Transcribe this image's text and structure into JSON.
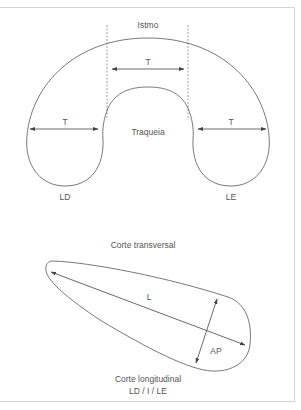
{
  "figure": {
    "transverse": {
      "isthmus_label": "Istmo",
      "trachea_label": "Traqueia",
      "right_lobe_label": "LD",
      "left_lobe_label": "LE",
      "measure_isthmus": "T",
      "measure_right_lobe": "T",
      "measure_left_lobe": "T",
      "caption": "Corte transversal"
    },
    "longitudinal": {
      "length_label": "L",
      "ap_label": "AP",
      "caption_line1": "Corte longitudinal",
      "caption_line2": "LD / I / LE"
    },
    "colors": {
      "stroke": "#555555",
      "dashed": "#777777",
      "text": "#555555",
      "frame": "#d4d4d4"
    }
  }
}
